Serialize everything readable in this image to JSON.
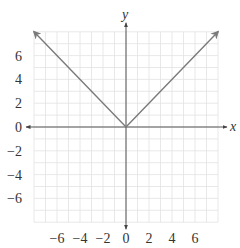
{
  "chart_data": {
    "type": "line",
    "title": "",
    "xlabel": "x",
    "ylabel": "y",
    "xlim": [
      -8,
      8
    ],
    "ylim": [
      -8,
      8
    ],
    "grid": true,
    "grid_step": 1,
    "x_ticks": [
      -6,
      -4,
      -2,
      0,
      2,
      4,
      6
    ],
    "y_ticks": [
      6,
      4,
      2,
      0,
      -2,
      -4,
      -6
    ],
    "x_tick_labels": [
      "−6",
      "−4",
      "−2",
      "0",
      "2",
      "4",
      "6"
    ],
    "y_tick_labels": [
      "6",
      "4",
      "2",
      "0",
      "−2",
      "−4",
      "−6"
    ],
    "series": [
      {
        "name": "y = |x|",
        "color": "#7a7a7a",
        "points": [
          [
            -8,
            8
          ],
          [
            0,
            0
          ],
          [
            8,
            8
          ]
        ],
        "arrows": "both"
      }
    ],
    "legend": null
  },
  "colors": {
    "grid": "#e2e2e2",
    "axis": "#555555",
    "curve": "#7a7a7a",
    "text": "#333333"
  }
}
